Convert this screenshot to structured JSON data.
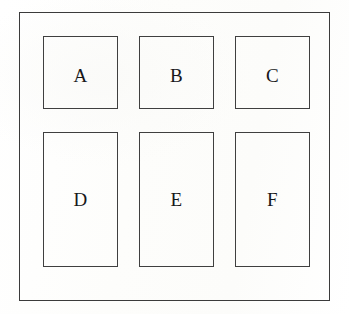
{
  "diagram": {
    "background_color": "#fdfdfc",
    "line_color": "#3f3f3f",
    "text_color": "#17171a",
    "frame": {
      "name": "outer-frame"
    },
    "rows": [
      {
        "name": "top-row",
        "cells": [
          {
            "label": "A"
          },
          {
            "label": "B"
          },
          {
            "label": "C"
          }
        ]
      },
      {
        "name": "bottom-row",
        "cells": [
          {
            "label": "D"
          },
          {
            "label": "E"
          },
          {
            "label": "F"
          }
        ]
      }
    ]
  }
}
